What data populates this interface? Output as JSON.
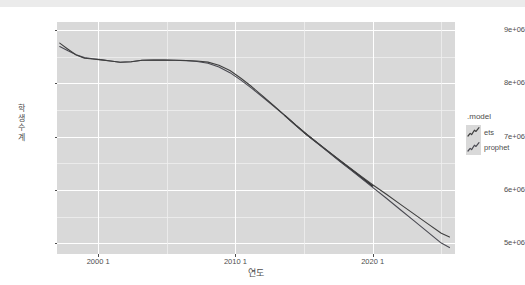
{
  "chart_data": {
    "type": "line",
    "title": "",
    "xlabel": "연도",
    "ylabel": "학생수계",
    "xlim": [
      1997.0,
      2026.0
    ],
    "ylim": [
      4800000,
      9150000
    ],
    "grid": true,
    "legend_position": "right",
    "legend_title": ".model",
    "x_tick_labels": [
      "2000 1",
      "2010 1",
      "2020 1"
    ],
    "x_tick_values": [
      2000,
      2010,
      2020
    ],
    "y_tick_labels": [
      "5e+06",
      "6e+06",
      "7e+06",
      "8e+06",
      "9e+06"
    ],
    "y_tick_values": [
      5000000,
      6000000,
      7000000,
      8000000,
      9000000
    ],
    "series": [
      {
        "name": "ets",
        "color": "#3f3f3f",
        "x": [
          1997.2,
          1997.8,
          1998.4,
          1999.0,
          1999.6,
          2000.2,
          2000.9,
          2001.6,
          2002.4,
          2003.2,
          2004.0,
          2004.8,
          2005.6,
          2006.4,
          2007.2,
          2008.0,
          2008.8,
          2009.6,
          2010.4,
          2011.2,
          2012.0,
          2012.8,
          2013.6,
          2014.4,
          2015.2,
          2016.0,
          2016.8,
          2017.6,
          2018.4,
          2019.2,
          2020.0,
          2021.0,
          2022.0,
          2023.0,
          2024.0,
          2025.0,
          2025.6
        ],
        "y": [
          8755000,
          8640000,
          8530000,
          8470000,
          8455000,
          8440000,
          8418000,
          8395000,
          8404000,
          8432000,
          8438000,
          8436000,
          8432000,
          8428000,
          8420000,
          8398000,
          8340000,
          8240000,
          8095000,
          7935000,
          7760000,
          7580000,
          7400000,
          7215000,
          7040000,
          6880000,
          6720000,
          6560000,
          6405000,
          6250000,
          6098000,
          5920000,
          5735000,
          5552000,
          5370000,
          5190000,
          5120000
        ]
      },
      {
        "name": "prophet",
        "color": "#4a4a52",
        "x": [
          1997.2,
          1997.8,
          1998.4,
          1999.0,
          1999.6,
          2000.2,
          2000.9,
          2001.6,
          2002.4,
          2003.2,
          2004.0,
          2004.8,
          2005.6,
          2006.4,
          2007.2,
          2008.0,
          2008.8,
          2009.6,
          2010.4,
          2011.2,
          2012.0,
          2012.8,
          2013.6,
          2014.4,
          2015.2,
          2016.0,
          2016.8,
          2017.6,
          2018.4,
          2019.2,
          2020.0,
          2021.0,
          2022.0,
          2023.0,
          2024.0,
          2025.0,
          2025.6
        ],
        "y": [
          8690000,
          8610000,
          8535000,
          8482000,
          8462000,
          8445000,
          8420000,
          8396000,
          8405000,
          8432000,
          8438000,
          8436000,
          8432000,
          8426000,
          8410000,
          8375000,
          8305000,
          8200000,
          8060000,
          7905000,
          7740000,
          7570000,
          7395000,
          7212000,
          7035000,
          6872000,
          6706000,
          6540000,
          6378000,
          6215000,
          6050000,
          5845000,
          5635000,
          5425000,
          5215000,
          5005000,
          4920000
        ]
      }
    ],
    "annotations": {
      "overlap_note": "historical region where both model fits coincide (darker)",
      "divergence_year": 2020
    }
  },
  "axes": {
    "y_title": "학생수계",
    "x_title": "연도"
  },
  "legend": {
    "title": ".model",
    "entries": [
      {
        "label": "ets",
        "color": "#3f3f3f",
        "key_icon": "line-zigzag-icon"
      },
      {
        "label": "prophet",
        "color": "#4a4a52",
        "key_icon": "line-zigzag-icon"
      }
    ]
  },
  "footer": {
    "caption": ""
  }
}
